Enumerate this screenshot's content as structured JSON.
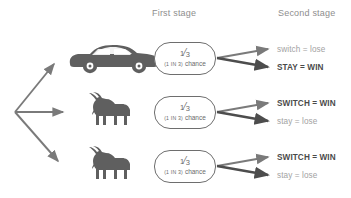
{
  "diagram": {
    "headers": {
      "first_stage": "First stage",
      "second_stage": "Second stage"
    },
    "colors": {
      "arrow": "#7a7a7a",
      "arrow_dark": "#4a4a4a",
      "node_border": "#6e6e6e",
      "text_win": "#4a4a4a",
      "text_lose": "#a2a2a2",
      "header_text": "#8e8e8e",
      "sprite": "#5f5f5f",
      "background": "#ffffff"
    },
    "branches": [
      {
        "prize": "car",
        "prize_icon": "sports-car-icon",
        "probability": {
          "fraction_numerator": "1",
          "fraction_denominator": "3",
          "sublabel_caps": "(1 IN 3)",
          "sublabel_rest": "chance"
        },
        "outcomes": [
          {
            "label": "switch = lose",
            "result": "lose",
            "emphasis": "normal"
          },
          {
            "label": "STAY = WIN",
            "result": "win",
            "emphasis": "bold"
          }
        ]
      },
      {
        "prize": "goat",
        "prize_icon": "goat-icon",
        "probability": {
          "fraction_numerator": "1",
          "fraction_denominator": "3",
          "sublabel_caps": "(1 IN 3)",
          "sublabel_rest": "chance"
        },
        "outcomes": [
          {
            "label": "SWITCH = WIN",
            "result": "win",
            "emphasis": "bold"
          },
          {
            "label": "stay = lose",
            "result": "lose",
            "emphasis": "normal"
          }
        ]
      },
      {
        "prize": "goat",
        "prize_icon": "goat-icon",
        "probability": {
          "fraction_numerator": "1",
          "fraction_denominator": "3",
          "sublabel_caps": "(1 IN 3)",
          "sublabel_rest": "chance"
        },
        "outcomes": [
          {
            "label": "SWITCH = WIN",
            "result": "win",
            "emphasis": "bold"
          },
          {
            "label": "stay = lose",
            "result": "lose",
            "emphasis": "normal"
          }
        ]
      }
    ]
  }
}
